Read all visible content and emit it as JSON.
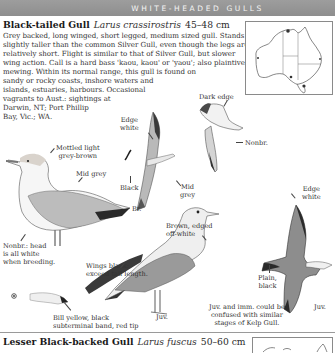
{
  "header": {
    "section_title": "WHITE-HEADED GULLS"
  },
  "species": [
    {
      "common_name": "Black-tailed Gull",
      "scientific_name": "Larus crassirostris",
      "size": "45–48 cm",
      "description_lines": [
        "Grey backed, long winged, short legged, medium sized gull. Stands",
        "slightly taller than the common Silver Gull, even though the legs are",
        "relatively short. Flight is similar to that of Silver Gull, but slower",
        "wing action. Call is a hard bass 'kaou, kaou' or 'yaou'; also plaintive",
        "mewing. Within its normal range, this gull is found on",
        "sandy or rocky coasts, inshore waters and",
        "islands, estuaries, harbours. Occasional",
        "vagrants to Aust.: sightings at",
        "Darwin, NT; Port Phillip",
        "Bay, Vic.; WA."
      ],
      "illustration_labels": {
        "dark_edge": "Dark edge",
        "edge_white_1": [
          "Edge",
          "white"
        ],
        "nonbr_flight": "Nonbr.",
        "mottled": [
          "Mottled light",
          "grey-brown"
        ],
        "mid_grey_standing": "Mid grey",
        "black": "Black",
        "mid_grey_flight": [
          "Mid",
          "grey"
        ],
        "br": "Br.",
        "brown_edged": [
          "Brown, edged",
          "off-white"
        ],
        "edge_white_2": [
          "Edge",
          "white"
        ],
        "nonbr_head": [
          "Nonbr.: head",
          "is all white",
          "when breeding."
        ],
        "wings_black": [
          "Wings black:",
          "exceed tail length."
        ],
        "plain_black": [
          "Plain,",
          "black"
        ],
        "juv_flight": "Juv.",
        "juv_standing": "Juv.",
        "juv_note": [
          "Juv. and imm. could be",
          "confused with similar",
          "stages of Kelp Gull."
        ],
        "bill_note": [
          "Bill yellow, black",
          "subterminal band, red tip"
        ]
      }
    },
    {
      "common_name": "Lesser Black-backed Gull",
      "scientific_name": "Larus fuscus",
      "size": "50–60 cm"
    }
  ],
  "colors": {
    "header_bar": "#939393",
    "header_text": "#f4f4f4",
    "ink": "#2a2a2a",
    "map_border": "#8a8a8a"
  }
}
